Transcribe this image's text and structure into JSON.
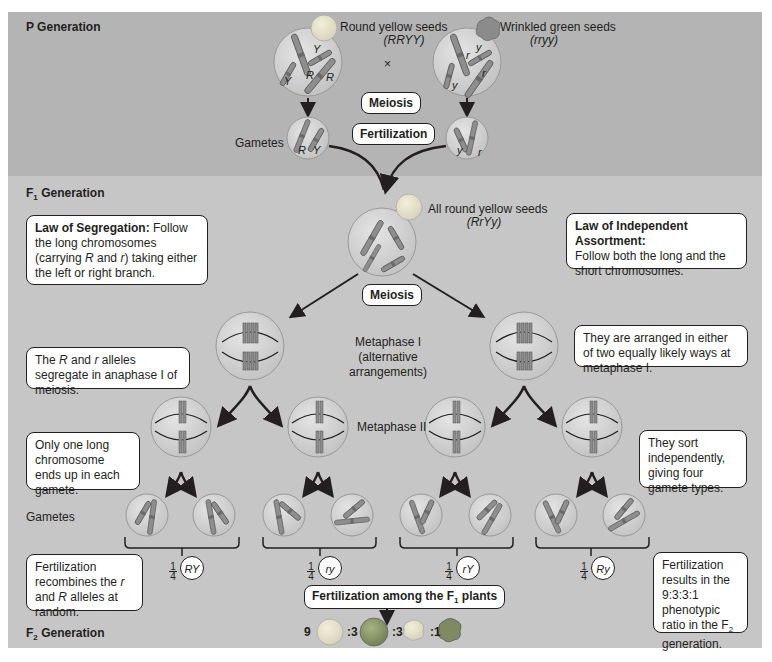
{
  "p_generation": {
    "title": "P Generation",
    "parent_left": {
      "label": "Round yellow seeds",
      "genotype": "(RRYY)",
      "alleles": [
        "Y",
        "R",
        "R",
        "Y"
      ]
    },
    "parent_right": {
      "label": "Wrinkled green seeds",
      "genotype": "(rryy)",
      "alleles": [
        "r",
        "y",
        "r",
        "y"
      ]
    },
    "cross_symbol": "×",
    "meiosis_label": "Meiosis",
    "fertilization_label": "Fertilization",
    "gametes_label": "Gametes",
    "gamete_left_alleles": [
      "R",
      "Y"
    ],
    "gamete_right_alleles": [
      "y",
      "r"
    ]
  },
  "f1_generation": {
    "title_prefix": "F",
    "title_sub": "1",
    "title_suffix": " Generation",
    "seed_label": "All round yellow seeds",
    "seed_genotype": "(RrYy)",
    "meiosis_label": "Meiosis",
    "metaphase1_label_lines": [
      "Metaphase I",
      "(alternative",
      "arrangements)"
    ],
    "metaphase2_label": "Metaphase II",
    "gametes_label": "Gametes",
    "callouts": {
      "segregation": {
        "title": "Law of Segregation:",
        "text_1": " Follow the long chromosomes (carrying ",
        "R": "R",
        "text_2": " and ",
        "r": "r",
        "text_3": ") taking either the left or right branch."
      },
      "independent": {
        "title": "Law of Independent Assortment:",
        "text": "Follow both the long and the short chromosomes."
      },
      "segregate_anaphase": {
        "text_1": "The ",
        "R": "R",
        "text_2": " and ",
        "r": "r",
        "text_3": " alleles segregate in anaphase I of meiosis."
      },
      "arranged": {
        "text": "They are arranged in either of two equally likely ways at metaphase I."
      },
      "one_long": {
        "text": "Only one long chromosome ends up in each gamete."
      },
      "sort_indep": {
        "text": "They sort independently, giving four gamete types."
      },
      "recombines": {
        "text_1": "Fertilization recombines the ",
        "r": "r",
        "text_2": " and ",
        "R": "R",
        "text_3": " alleles at random."
      },
      "ratio_result": {
        "text_1": "Fertilization results in the 9:3:3:1 phenotypic ratio in the F",
        "sub": "2",
        "text_2": " generation."
      }
    },
    "gamete_types": [
      {
        "fraction_num": "1",
        "fraction_den": "4",
        "genotype": "RY"
      },
      {
        "fraction_num": "1",
        "fraction_den": "4",
        "genotype": "ry"
      },
      {
        "fraction_num": "1",
        "fraction_den": "4",
        "genotype": "rY"
      },
      {
        "fraction_num": "1",
        "fraction_den": "4",
        "genotype": "Ry"
      }
    ],
    "fertilization_among_prefix": "Fertilization among the F",
    "fertilization_among_sub": "1",
    "fertilization_among_suffix": " plants"
  },
  "f2_generation": {
    "title_prefix": "F",
    "title_sub": "2",
    "title_suffix": " Generation",
    "ratio": [
      {
        "count": "9",
        "phenotype": "round yellow",
        "color": "#e6e2c8"
      },
      {
        "count": ":3",
        "phenotype": "round green",
        "color": "#8a9a6a"
      },
      {
        "count": ":3",
        "phenotype": "wrinkled yellow",
        "color": "#e6e2c8"
      },
      {
        "count": ":1",
        "phenotype": "wrinkled green",
        "color": "#7d8a62"
      }
    ]
  },
  "colors": {
    "p_band": "#b4b4b4",
    "f_band": "#c6c6c6",
    "cell_fill": "#cfcfcf",
    "chromosome": "#8a8a8a",
    "ink": "#231f20"
  }
}
